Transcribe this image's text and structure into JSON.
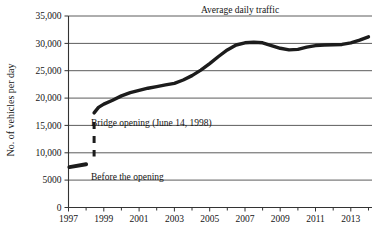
{
  "chart_data": {
    "type": "line",
    "title": "Average daily traffic",
    "xlabel": "",
    "ylabel": "No. of vehicles per day",
    "xlim": [
      1997,
      2014.2
    ],
    "ylim": [
      0,
      35000
    ],
    "grid": true,
    "legend_position": "none",
    "y_ticks": [
      0,
      5000,
      10000,
      15000,
      20000,
      25000,
      30000,
      35000
    ],
    "y_tick_labels": [
      "0",
      "5000",
      "10,000",
      "15,000",
      "20,000",
      "25,000",
      "30,000",
      "35,000"
    ],
    "x_ticks": [
      1997,
      1998,
      1999,
      2000,
      2001,
      2002,
      2003,
      2004,
      2005,
      2006,
      2007,
      2008,
      2009,
      2010,
      2011,
      2012,
      2013,
      2014
    ],
    "x_tick_labels_major": [
      "1997",
      "1999",
      "2001",
      "2003",
      "2005",
      "2007",
      "2009",
      "2011",
      "2013"
    ],
    "x_major_years": [
      1997,
      1999,
      2001,
      2003,
      2005,
      2007,
      2009,
      2011,
      2013
    ],
    "series": [
      {
        "name": "Average daily traffic after bridge opening",
        "x": [
          1998.45,
          1998.7,
          1999.0,
          1999.5,
          2000.0,
          2000.5,
          2001.0,
          2001.5,
          2002.0,
          2002.5,
          2003.0,
          2003.5,
          2004.0,
          2004.5,
          2005.0,
          2005.5,
          2006.0,
          2006.5,
          2007.0,
          2007.5,
          2008.0,
          2008.5,
          2009.0,
          2009.5,
          2010.0,
          2010.5,
          2011.0,
          2011.5,
          2012.0,
          2012.5,
          2013.0,
          2013.5,
          2014.0
        ],
        "y": [
          17300,
          18300,
          18900,
          19600,
          20400,
          21000,
          21400,
          21800,
          22100,
          22400,
          22700,
          23300,
          24100,
          25100,
          26300,
          27600,
          28800,
          29700,
          30100,
          30200,
          30100,
          29600,
          29100,
          28800,
          28900,
          29300,
          29600,
          29700,
          29750,
          29800,
          30100,
          30600,
          31200
        ]
      }
    ],
    "annotations": [
      {
        "name": "bridge-opening",
        "label": "Bridge opening (June 14, 1998)",
        "year": 1998.45,
        "line_style": "dashed",
        "line_from_y": 15600,
        "line_to_y": 9300
      },
      {
        "name": "before-the-opening",
        "label": "Before the opening",
        "year_start": 1997.05,
        "year_end": 1998.0,
        "value": 7600,
        "line_style": "solid"
      }
    ]
  }
}
